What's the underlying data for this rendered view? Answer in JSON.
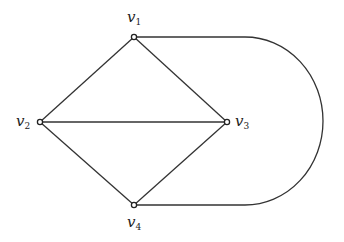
{
  "graph": {
    "vertices": [
      {
        "id": "v1",
        "name": "v",
        "sub": "1",
        "x": 134,
        "y": 37
      },
      {
        "id": "v2",
        "name": "v",
        "sub": "2",
        "x": 40,
        "y": 122
      },
      {
        "id": "v3",
        "name": "v",
        "sub": "3",
        "x": 227,
        "y": 122
      },
      {
        "id": "v4",
        "name": "v",
        "sub": "4",
        "x": 134,
        "y": 205
      }
    ],
    "edges": [
      [
        "v1",
        "v2"
      ],
      [
        "v1",
        "v3"
      ],
      [
        "v2",
        "v3"
      ],
      [
        "v2",
        "v4"
      ],
      [
        "v3",
        "v4"
      ],
      [
        "v1",
        "v4 (curved arc)"
      ]
    ],
    "line_color": "#333333"
  }
}
